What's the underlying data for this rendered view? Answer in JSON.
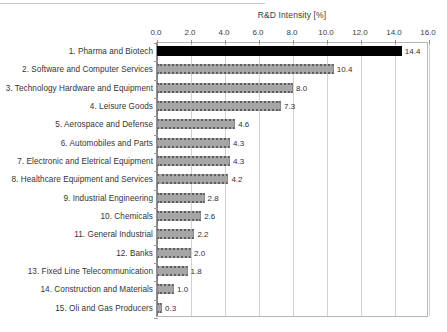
{
  "chart_data": {
    "type": "bar",
    "orientation": "horizontal",
    "title": "R&D Intensity [%]",
    "xlabel": "",
    "ylabel": "",
    "xlim": [
      0.0,
      16.0
    ],
    "xticks": [
      "0.0",
      "2.0",
      "4.0",
      "6.0",
      "8.0",
      "10.0",
      "12.0",
      "14.0",
      "16.0"
    ],
    "xtick_values": [
      0,
      2,
      4,
      6,
      8,
      10,
      12,
      14,
      16
    ],
    "grid": "vertical",
    "legend": "none",
    "categories": [
      "1. Pharma and Biotech",
      "2. Software and Computer Services",
      "3. Technology Hardware and Equipment",
      "4. Leisure Goods",
      "5. Aerospace and Defense",
      "6. Automobiles and Parts",
      "7. Electronic and Eletrical Equipment",
      "8. Healthcare Equipment and Services",
      "9. Industrial Engineering",
      "10. Chemicals",
      "11. General Industrial",
      "12. Banks",
      "13. Fixed Line Telecommunication",
      "14. Construction and Materials",
      "15. Oli and Gas Producers"
    ],
    "values": [
      14.4,
      10.4,
      8.0,
      7.3,
      4.6,
      4.3,
      4.3,
      4.2,
      2.8,
      2.6,
      2.2,
      2.0,
      1.8,
      1.0,
      0.3
    ],
    "value_labels": [
      "14.4",
      "10.4",
      "8.0",
      "7.3",
      "4.6",
      "4.3",
      "4.3",
      "4.2",
      "2.8",
      "2.6",
      "2.2",
      "2.0",
      "1.8",
      "1.0",
      "0.3"
    ],
    "highlight_index": 0,
    "colors": {
      "bar": "#a6a6a6",
      "bar_highlight": "#000000",
      "bar_pattern": "#5e5e5e",
      "grid": "#d2d2d6",
      "axis": "#8f8f93",
      "text": "#343434"
    }
  }
}
